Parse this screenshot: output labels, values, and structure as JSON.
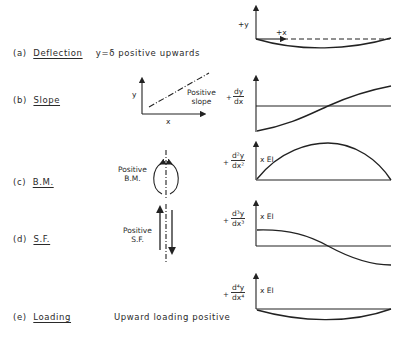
{
  "rows": [
    {
      "id": "a",
      "tag": "(a)",
      "name": "Deflection",
      "note": "y=δ  positive upwards"
    },
    {
      "id": "b",
      "tag": "(b)",
      "name": "Slope",
      "note": ""
    },
    {
      "id": "c",
      "tag": "(c)",
      "name": "B.M.",
      "note": ""
    },
    {
      "id": "d",
      "tag": "(d)",
      "name": "S.F.",
      "note": ""
    },
    {
      "id": "e",
      "tag": "(e)",
      "name": "Loading",
      "note": "Upward  loading positive"
    }
  ],
  "plots": {
    "deflection": {
      "y_label": "+y",
      "x_label": "+x"
    },
    "slope": {
      "plus": "+",
      "num": "dy",
      "den": "dx"
    },
    "bm": {
      "plus": "+",
      "num": "d²y",
      "den": "dx²",
      "factor": "x EI"
    },
    "sf": {
      "plus": "+",
      "num": "d³y",
      "den": "dx³",
      "factor": "x EI"
    },
    "loading": {
      "plus": "+",
      "num": "d⁴y",
      "den": "dx⁴",
      "factor": "x EI"
    }
  },
  "sketches": {
    "slope": {
      "y_axis": "y",
      "x_axis": "x",
      "label_line1": "Positive",
      "label_line2": "slope"
    },
    "bm": {
      "label_line1": "Positive",
      "label_line2": "B.M."
    },
    "sf": {
      "label_line1": "Positive",
      "label_line2": "S.F."
    }
  }
}
